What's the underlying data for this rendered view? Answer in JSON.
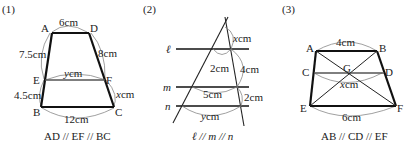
{
  "problems": [
    {
      "number": "(1)",
      "vertices": {
        "A": "A",
        "D": "D",
        "E": "E",
        "F": "F",
        "B": "B",
        "C": "C"
      },
      "measures": {
        "AD": "6cm",
        "AE": "7.5cm",
        "DF": "8cm",
        "EF_var": "y",
        "EF_unit": "cm",
        "EB": "4.5cm",
        "FC_var": "x",
        "FC_unit": "cm",
        "BC": "12cm"
      },
      "condition": "AD // EF // BC"
    },
    {
      "number": "(2)",
      "lines": {
        "l": "ℓ",
        "m": "m",
        "n": "n"
      },
      "measures": {
        "top_var": "x",
        "top_unit": "cm",
        "l_seg": "2cm",
        "right_lm": "4cm",
        "m_seg": "5cm",
        "right_mn": "2cm",
        "n_var": "y",
        "n_unit": "cm"
      },
      "condition": "ℓ // m // n"
    },
    {
      "number": "(3)",
      "vertices": {
        "A": "A",
        "B": "B",
        "C": "C",
        "D": "D",
        "G": "G",
        "E": "E",
        "F": "F"
      },
      "measures": {
        "AB": "4cm",
        "CD_var": "x",
        "CD_unit": "cm",
        "EF": "6cm"
      },
      "condition": "AB // CD // EF"
    }
  ]
}
